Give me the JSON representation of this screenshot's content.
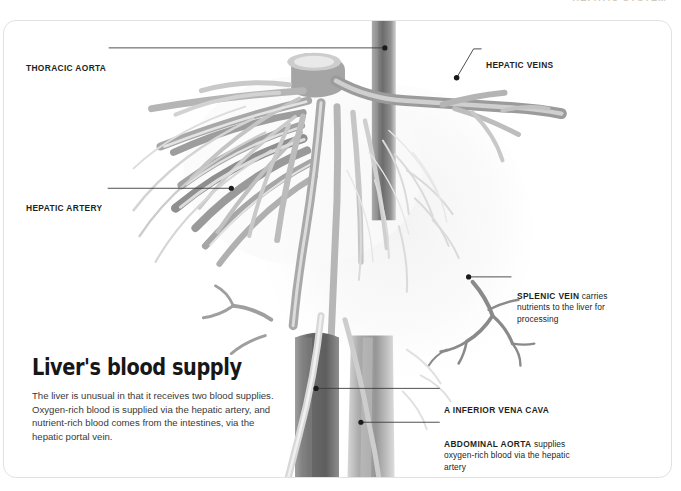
{
  "running_head": "HEPATIC SYSTEM",
  "card": {
    "border_color": "#e2e2e2",
    "background": "#ffffff"
  },
  "illustration": {
    "name": "liver-vascular-tree",
    "description": "Grayscale anatomical rendering of the liver's blood vessels: a vertical aorta trunk with radiating hepatic artery branches to the left, hepatic veins to the upper right, the splenic vein branching at mid-right, and the inferior vena cava and abdominal aorta descending at the bottom.",
    "palette": {
      "vessel_dark": "#6e6e6e",
      "vessel_mid": "#9a9a9a",
      "vessel_light": "#c9c9c9",
      "vessel_pale": "#e8e8e8",
      "trunk_dark": "#7a7a7a"
    }
  },
  "callouts": [
    {
      "id": "thoracic-aorta",
      "term": "THORACIC AORTA",
      "rest": "",
      "side": "left"
    },
    {
      "id": "hepatic-artery",
      "term": "HEPATIC ARTERY",
      "rest": "",
      "side": "left"
    },
    {
      "id": "hepatic-veins",
      "term": "HEPATIC VEINS",
      "rest": "",
      "side": "right"
    },
    {
      "id": "splenic-vein",
      "term": "SPLENIC VEIN",
      "rest": " carries nutrients to the liver for processing",
      "side": "right"
    },
    {
      "id": "inferior-vena-cava",
      "term": "A INFERIOR VENA CAVA",
      "rest": "",
      "side": "right"
    },
    {
      "id": "abdominal-aorta",
      "term": "ABDOMINAL AORTA",
      "rest": " supplies oxygen-rich blood via the hepatic artery",
      "side": "right"
    }
  ],
  "deck": {
    "title": "Liver's blood supply",
    "body": "The liver is unusual in that it receives two blood supplies. Oxygen-rich blood is supplied via the hepatic artery, and nutrient-rich blood comes from the intestines, via the hepatic portal vein."
  }
}
